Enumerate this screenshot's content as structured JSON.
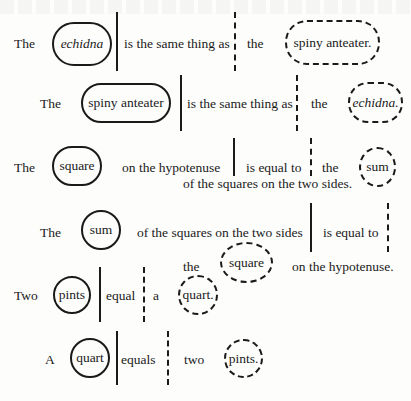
{
  "rows": [
    {
      "subject_prefix": "The",
      "subject": "echidna",
      "copula": "is the same thing as",
      "object_prefix": "the",
      "object": "spiny anteater."
    },
    {
      "subject_prefix": "The",
      "subject": "spiny anteater",
      "copula": "is the same thing as",
      "object_prefix": "the",
      "object": "echidna."
    },
    {
      "subject_prefix": "The",
      "subject": "square",
      "subject_suffix": "on the hypotenuse",
      "copula": "is equal to",
      "object_prefix": "the",
      "object": "sum",
      "object_suffix": "of the squares on the two sides."
    },
    {
      "subject_prefix": "The",
      "subject": "sum",
      "subject_suffix": "of the squares on the two sides",
      "copula": "is equal to",
      "object_prefix": "the",
      "object": "square",
      "object_suffix": "on the hypotenuse."
    },
    {
      "subject_prefix": "Two",
      "subject": "pints",
      "copula": "equal",
      "object_prefix": "a",
      "object": "quart."
    },
    {
      "subject_prefix": "A",
      "subject": "quart",
      "copula": "equals",
      "object_prefix": "two",
      "object": "pints."
    }
  ],
  "legend": {
    "solid_shape": "subject term (solid outline)",
    "dashed_shape": "object term (dashed outline)",
    "solid_line": "subject/predicate divider",
    "dashed_line": "copula/object divider"
  },
  "colors": {
    "ink": "#1a1a1a",
    "paper": "#fdfdfc"
  }
}
